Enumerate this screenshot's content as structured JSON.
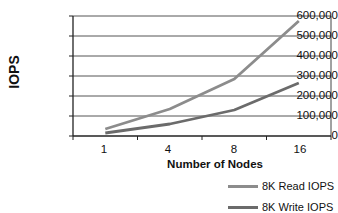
{
  "chart_data": {
    "type": "line",
    "title": "",
    "xlabel": "Number of Nodes",
    "ylabel": "IOPS",
    "categories": [
      "1",
      "4",
      "8",
      "16"
    ],
    "series": [
      {
        "name": "8K Read IOPS",
        "color": "#8c8c8c",
        "values": [
          35000,
          135000,
          285000,
          575000
        ]
      },
      {
        "name": "8K Write IOPS",
        "color": "#6b6b6b",
        "values": [
          15000,
          60000,
          130000,
          265000
        ]
      }
    ],
    "ylim": [
      0,
      600000
    ],
    "yticks": [
      "0",
      "100,000",
      "200,000",
      "300,000",
      "400,000",
      "500,000",
      "600,000"
    ],
    "grid": true,
    "legend_position": "bottom-right"
  },
  "legend": {
    "read_label": "8K Read IOPS",
    "write_label": "8K Write IOPS"
  },
  "axes": {
    "x_title": "Number of Nodes",
    "y_title": "IOPS",
    "x_ticks": [
      "1",
      "4",
      "8",
      "16"
    ],
    "y_ticks": [
      "600,000",
      "500,000",
      "400,000",
      "300,000",
      "200,000",
      "100,000",
      "0"
    ]
  }
}
